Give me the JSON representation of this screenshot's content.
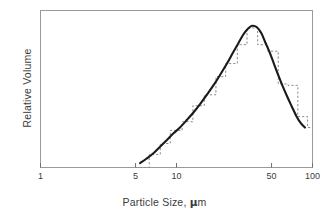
{
  "figure": {
    "background": "#ffffff",
    "frame_color": "#9a9a9a",
    "curve_color": "#1a1a1a",
    "histogram_color": "#8a8a8a",
    "text_color": "#3c3c3c"
  },
  "axes": {
    "x_title_prefix": "Particle Size, ",
    "x_title_mu": "μ",
    "x_title_suffix": "m",
    "y_title": "Relative Volume"
  },
  "chart_data": {
    "type": "line",
    "title": "",
    "subtitle": "",
    "xlabel": "Particle Size, μm",
    "ylabel": "Relative Volume",
    "x_scale": "log",
    "xlim": [
      1,
      100
    ],
    "ylim": [
      0,
      1.08
    ],
    "grid": false,
    "legend": null,
    "x_ticks": [
      1,
      5,
      10,
      50,
      100
    ],
    "x_tick_labels": [
      "1",
      "5",
      "10",
      "50",
      "100"
    ],
    "y_ticks": [],
    "y_tick_labels": [],
    "annotations": [],
    "series": [
      {
        "name": "smooth fit curve",
        "style": "solid",
        "color": "#1a1a1a",
        "x": [
          5.4,
          6.0,
          6.8,
          7.6,
          8.5,
          9.5,
          10.6,
          12.0,
          13.5,
          15.0,
          17.0,
          19.0,
          21.0,
          23.5,
          26.0,
          28.5,
          31.0,
          33.5,
          36.0,
          39.0,
          42.0,
          45.0,
          48.0,
          52.0,
          56.0,
          60.0,
          65.0,
          70.0,
          76.0,
          82.0,
          88.0
        ],
        "y": [
          0.03,
          0.06,
          0.1,
          0.145,
          0.19,
          0.235,
          0.275,
          0.33,
          0.385,
          0.44,
          0.51,
          0.575,
          0.64,
          0.715,
          0.79,
          0.855,
          0.915,
          0.955,
          0.975,
          0.965,
          0.925,
          0.86,
          0.8,
          0.715,
          0.635,
          0.565,
          0.49,
          0.425,
          0.355,
          0.305,
          0.275
        ]
      },
      {
        "name": "measured histogram",
        "style": "dashed-step",
        "color": "#8a8a8a",
        "bin_edges": [
          5.0,
          6.3,
          7.6,
          9.0,
          11.0,
          13.2,
          16.0,
          19.5,
          23.0,
          28.0,
          33.0,
          39.5,
          47.0,
          56.0,
          66.0,
          78.0,
          92.0
        ],
        "bin_values": [
          0.0,
          0.09,
          0.165,
          0.255,
          0.315,
          0.425,
          0.5,
          0.625,
          0.715,
          0.845,
          0.96,
          0.845,
          0.8,
          0.575,
          0.565,
          0.35,
          0.275
        ]
      }
    ]
  }
}
